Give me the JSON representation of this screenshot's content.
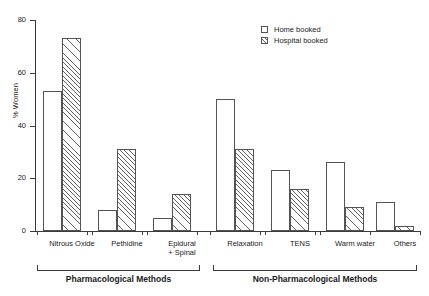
{
  "chart_data": {
    "type": "bar",
    "title": "",
    "xlabel": "",
    "ylabel": "% Women",
    "ylim": [
      0,
      80
    ],
    "yticks": [
      0,
      20,
      40,
      60,
      80
    ],
    "grid": false,
    "legend_position": "top-right",
    "categories": [
      "Nitrous Oxide",
      "Pethidine",
      "Epidural\n+ Spinal",
      "Relaxation",
      "TENS",
      "Warm water",
      "Others"
    ],
    "series": [
      {
        "name": "Home booked",
        "values": [
          53,
          8,
          5,
          50,
          23,
          26,
          11
        ]
      },
      {
        "name": "Hospital booked",
        "values": [
          73,
          31,
          14,
          31,
          16,
          9,
          2
        ]
      }
    ],
    "groups": [
      {
        "label": "Pharmacological Methods",
        "categories": [
          "Nitrous Oxide",
          "Pethidine",
          "Epidural + Spinal"
        ]
      },
      {
        "label": "Non-Pharmacological Methods",
        "categories": [
          "Relaxation",
          "TENS",
          "Warm water",
          "Others"
        ]
      }
    ]
  },
  "legend": {
    "items": [
      {
        "label": "Home booked",
        "style": "open"
      },
      {
        "label": "Hospital booked",
        "style": "hatched"
      }
    ]
  },
  "axis": {
    "y_label": "% Women",
    "y_tick_labels": [
      "0",
      "20",
      "40",
      "60",
      "80"
    ]
  }
}
